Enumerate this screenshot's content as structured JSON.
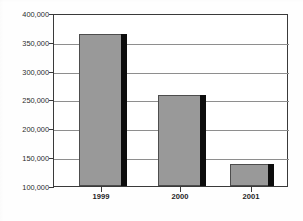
{
  "chart_data": {
    "type": "bar",
    "title": "",
    "xlabel": "",
    "ylabel": "",
    "categories": [
      "1999",
      "2000",
      "2001"
    ],
    "values": [
      366000,
      260000,
      138000
    ],
    "ylim": [
      100000,
      400000
    ],
    "ytick_values": [
      400000,
      350000,
      300000,
      250000,
      200000,
      150000,
      100000
    ],
    "ytick_labels": [
      "400,000",
      "350,000",
      "300,000",
      "250,000",
      "200,000",
      "150,000",
      "100,000"
    ],
    "grid": true,
    "legend": "none",
    "bar_color": "#999999",
    "bar_edge_color": "#4d4d4d",
    "bar_shadow_color": "#0d0d0d",
    "gridline_color": "#8e8e8e",
    "axis_color": "#3a3a3a",
    "background_color": "#ffffff"
  },
  "axes": {
    "y": {
      "ticks": [
        {
          "label": "400,000",
          "value": 400000
        },
        {
          "label": "350,000",
          "value": 350000
        },
        {
          "label": "300,000",
          "value": 300000
        },
        {
          "label": "250,000",
          "value": 250000
        },
        {
          "label": "200,000",
          "value": 200000
        },
        {
          "label": "150,000",
          "value": 150000
        },
        {
          "label": "100,000",
          "value": 100000
        }
      ]
    },
    "x": {
      "ticks": [
        {
          "label": "1999"
        },
        {
          "label": "2000"
        },
        {
          "label": "2001"
        }
      ]
    }
  },
  "bars": [
    {
      "category": "1999",
      "value": 366000
    },
    {
      "category": "2000",
      "value": 260000
    },
    {
      "category": "2001",
      "value": 138000
    }
  ],
  "artifacts": {
    "cropped_title_fragment": ""
  }
}
